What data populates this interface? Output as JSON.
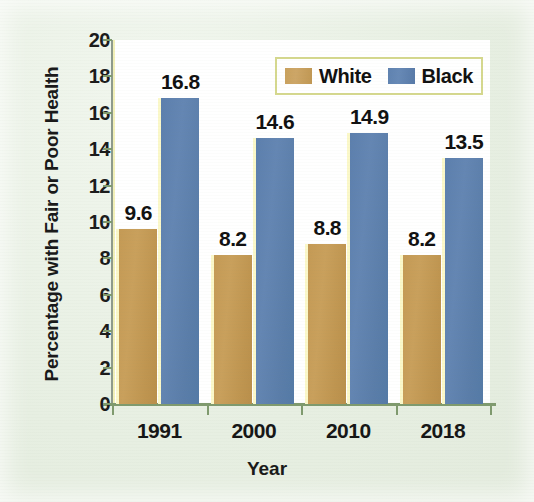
{
  "chart_data": {
    "type": "bar",
    "title": "",
    "subtitle": "",
    "xlabel": "Year",
    "ylabel": "Percentage with Fair or Poor Health",
    "categories": [
      "1991",
      "2000",
      "2010",
      "2018"
    ],
    "series": [
      {
        "name": "White",
        "color": "#c49a55",
        "values": [
          9.6,
          8.2,
          8.8,
          8.2
        ],
        "labels": [
          "9.6",
          "8.2",
          "8.8",
          "8.2"
        ]
      },
      {
        "name": "Black",
        "color": "#5c7fad",
        "values": [
          16.8,
          14.6,
          14.9,
          13.5
        ],
        "labels": [
          "16.8",
          "14.6",
          "14.9",
          "13.5"
        ]
      }
    ],
    "ylim": [
      0,
      20
    ],
    "ytick_step": 2,
    "yticks": [
      "20",
      "18",
      "16",
      "14",
      "12",
      "10",
      "8",
      "6",
      "4",
      "2",
      "0"
    ],
    "ytick_values": [
      20,
      18,
      16,
      14,
      12,
      10,
      8,
      6,
      4,
      2,
      0
    ],
    "grid": false,
    "legend_position": "top-right",
    "plot_background": "#ffffff",
    "figure_background": "#e7efe2",
    "axis_color": "#7f9a6e"
  },
  "legend": {
    "entries": [
      {
        "label": "White",
        "swatch": "white-swatch"
      },
      {
        "label": "Black",
        "swatch": "black-swatch"
      }
    ]
  },
  "axes": {
    "y_title": "Percentage with Fair or Poor Health",
    "x_title": "Year"
  }
}
